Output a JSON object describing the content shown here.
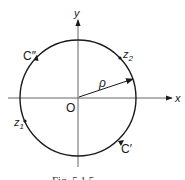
{
  "figure": {
    "axes": {
      "x_label": "x",
      "y_label": "y",
      "origin_label": "O"
    },
    "radius_label": "ρ",
    "points": [
      {
        "name": "z",
        "subscript": "2"
      },
      {
        "name": "z",
        "subscript": "1"
      }
    ],
    "curves": [
      {
        "label": "C″"
      },
      {
        "label": "C′"
      }
    ],
    "caption": "Fig. 5.1.5"
  }
}
